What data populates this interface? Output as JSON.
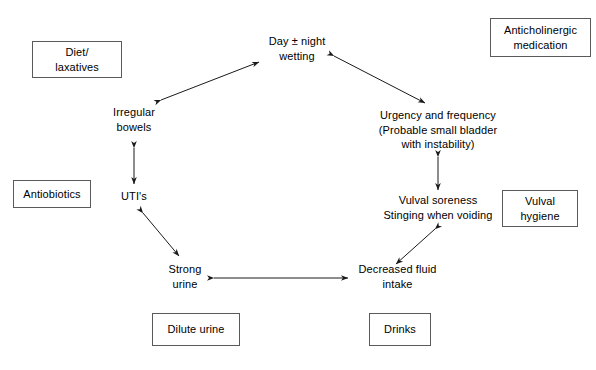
{
  "diagram": {
    "background_color": "#ffffff",
    "text_color": "#000000",
    "box_border_color": "#5a5a5a",
    "arrow_color": "#1a1a1a",
    "nodes": [
      {
        "id": "day-night-wetting",
        "label": "Day ± night\nwetting"
      },
      {
        "id": "irregular-bowels",
        "label": "Irregular\nbowels"
      },
      {
        "id": "urgency-frequency",
        "label": "Urgency and frequency\n(Probable small bladder\nwith instability)"
      },
      {
        "id": "utis",
        "label": "UTI's"
      },
      {
        "id": "vulval-soreness",
        "label": "Vulval soreness\nStinging when voiding"
      },
      {
        "id": "strong-urine",
        "label": "Strong\nurine"
      },
      {
        "id": "decreased-fluid-intake",
        "label": "Decreased fluid\nintake"
      }
    ],
    "boxes": [
      {
        "id": "diet-laxatives",
        "label": "Diet/\nlaxatives"
      },
      {
        "id": "anticholinergic-medication",
        "label": "Anticholinergic\nmedication"
      },
      {
        "id": "antiobiotics",
        "label": "Antiobiotics"
      },
      {
        "id": "vulval-hygiene",
        "label": "Vulval\nhygiene"
      },
      {
        "id": "dilute-urine",
        "label": "Dilute urine"
      },
      {
        "id": "drinks",
        "label": "Drinks"
      }
    ],
    "connections": [
      {
        "id": "irregular-bowels-to-wetting",
        "from": "irregular-bowels",
        "to": "day-night-wetting",
        "style": "double-headed"
      },
      {
        "id": "wetting-to-urgency",
        "from": "day-night-wetting",
        "to": "urgency-frequency",
        "style": "double-headed"
      },
      {
        "id": "irregular-bowels-to-utis",
        "from": "irregular-bowels",
        "to": "utis",
        "style": "double-headed"
      },
      {
        "id": "urgency-to-vulval-soreness",
        "from": "urgency-frequency",
        "to": "vulval-soreness",
        "style": "double-headed"
      },
      {
        "id": "utis-to-strong-urine",
        "from": "utis",
        "to": "strong-urine",
        "style": "double-headed"
      },
      {
        "id": "vulval-soreness-to-decreased-fluid",
        "from": "vulval-soreness",
        "to": "decreased-fluid-intake",
        "style": "double-headed"
      },
      {
        "id": "strong-urine-to-decreased-fluid",
        "from": "strong-urine",
        "to": "decreased-fluid-intake",
        "style": "double-headed"
      }
    ]
  },
  "bottom_caption": ""
}
